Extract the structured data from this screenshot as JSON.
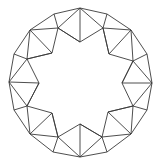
{
  "diagram": {
    "title": "Round brilliant cut diamond, crown view",
    "stroke_color": "#3a3a3a",
    "background": "#ffffff",
    "girdle": [
      [
        80,
        8
      ],
      [
        107,
        14
      ],
      [
        131,
        30
      ],
      [
        147,
        54
      ],
      [
        152,
        83
      ],
      [
        147,
        110
      ],
      [
        131,
        134
      ],
      [
        107,
        152
      ],
      [
        80,
        157
      ],
      [
        53,
        152
      ],
      [
        30,
        134
      ],
      [
        14,
        110
      ],
      [
        9,
        82
      ],
      [
        14,
        54
      ],
      [
        30,
        30
      ],
      [
        54,
        14
      ]
    ],
    "table": [
      [
        80,
        42
      ],
      [
        109,
        54
      ],
      [
        122,
        83
      ],
      [
        108,
        112
      ],
      [
        80,
        124
      ],
      [
        52,
        113
      ],
      [
        39,
        83
      ],
      [
        52,
        53
      ]
    ],
    "star_points": [
      [
        103,
        28
      ],
      [
        133,
        61
      ],
      [
        133,
        106
      ],
      [
        102,
        137
      ],
      [
        58,
        137
      ],
      [
        27,
        106
      ],
      [
        27,
        59
      ],
      [
        58,
        28
      ]
    ]
  }
}
